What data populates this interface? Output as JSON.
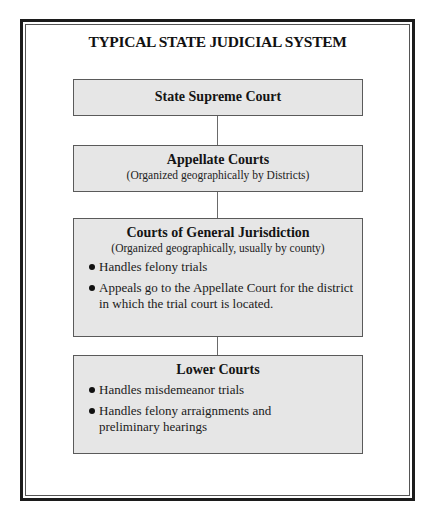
{
  "title": "TYPICAL STATE JUDICIAL SYSTEM",
  "boxes": {
    "supreme": {
      "heading": "State Supreme Court"
    },
    "appellate": {
      "heading": "Appellate Courts",
      "subtitle": "(Organized geographically by Districts)"
    },
    "general": {
      "heading": "Courts of General Jurisdiction",
      "subtitle": "(Organized geographically, usually by county)",
      "bullets": [
        "Handles felony trials",
        "Appeals go to the Appellate Court for the district in which the trial court is located."
      ]
    },
    "lower": {
      "heading": "Lower Courts",
      "bullets": [
        "Handles misdemeanor trials",
        "Handles felony arraignments and preliminary hearings"
      ]
    }
  },
  "colors": {
    "box_fill": "#e6e6e6",
    "box_border": "#5a5a5a",
    "frame": "#1c1c1c",
    "connector": "#6a6a6a"
  }
}
